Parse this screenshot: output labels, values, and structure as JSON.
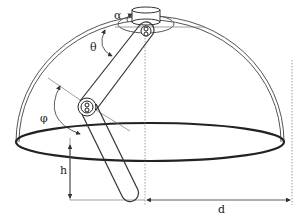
{
  "diagram": {
    "title": "",
    "labels": {
      "alpha": "α",
      "theta": "θ",
      "phi": "φ",
      "h": "h",
      "d": "d"
    },
    "components": [
      "hemispherical-dome",
      "base-ellipse",
      "top-mount",
      "upper-arm-link",
      "lower-arm-link",
      "joint-upper",
      "joint-lower"
    ],
    "colors": {
      "stroke": "#333333",
      "guide": "#777777",
      "background": "#ffffff"
    }
  }
}
